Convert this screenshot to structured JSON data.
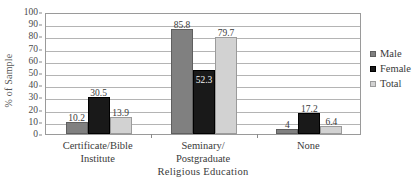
{
  "chart_data": {
    "type": "bar",
    "title": "",
    "xlabel": "Religious Education",
    "ylabel": "% of Sample",
    "ylim": [
      0,
      100
    ],
    "ytick_step": 10,
    "yticks": [
      "100",
      "90",
      "80",
      "70",
      "60",
      "50",
      "40",
      "30",
      "20",
      "10",
      "0"
    ],
    "grid": true,
    "legend_position": "right",
    "categories": [
      "Certificate/Bible Institute",
      "Seminary/ Postgraduate",
      "None"
    ],
    "category_lines": [
      {
        "line1": "Certificate/Bible",
        "line2": "Institute"
      },
      {
        "line1": "Seminary/",
        "line2": "Postgraduate"
      },
      {
        "line1": "None",
        "line2": ""
      }
    ],
    "series": [
      {
        "name": "Male",
        "color": "#808080",
        "values": [
          10.2,
          85.8,
          4.0
        ],
        "labels": [
          "10.2",
          "85.8",
          "4"
        ]
      },
      {
        "name": "Female",
        "color": "#191919",
        "values": [
          30.5,
          52.3,
          17.2
        ],
        "labels": [
          "30.5",
          "52.3",
          "17.2"
        ]
      },
      {
        "name": "Total",
        "color": "#d2d2d2",
        "values": [
          13.9,
          79.7,
          6.4
        ],
        "labels": [
          "13.9",
          "79.7",
          "6.4"
        ]
      }
    ]
  },
  "legend": {
    "items": [
      {
        "label": "Male"
      },
      {
        "label": "Female"
      },
      {
        "label": "Total"
      }
    ]
  },
  "axes": {
    "y_title": "% of Sample",
    "x_title": "Religious Education"
  }
}
